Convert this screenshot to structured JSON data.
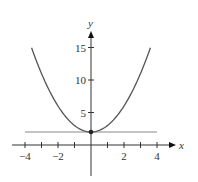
{
  "chart_data": {
    "type": "line",
    "title": "",
    "xlabel": "x",
    "ylabel": "y",
    "xlim": [
      -4.2,
      4.6
    ],
    "ylim": [
      -4,
      18
    ],
    "grid": false,
    "x_ticks": [
      -4,
      -3,
      -2,
      -1,
      1,
      2,
      3,
      4
    ],
    "x_tick_labels": [
      {
        "value": -4,
        "label": "−4"
      },
      {
        "value": -2,
        "label": "−2"
      },
      {
        "value": 2,
        "label": "2"
      },
      {
        "value": 4,
        "label": "4"
      }
    ],
    "y_ticks": [
      5,
      10,
      15
    ],
    "y_tick_labels": [
      {
        "value": 5,
        "label": "5"
      },
      {
        "value": 10,
        "label": "10"
      },
      {
        "value": 15,
        "label": "15"
      }
    ],
    "series": [
      {
        "name": "y = x^2 + 2",
        "kind": "curve",
        "color": "#555555",
        "x": [
          -3.6,
          -3,
          -2,
          -1,
          0,
          1,
          2,
          3,
          3.6
        ],
        "y": [
          14.96,
          11,
          6,
          3,
          2,
          3,
          6,
          11,
          14.96
        ]
      },
      {
        "name": "y = 2",
        "kind": "horizontal-line",
        "color": "#888888",
        "x": [
          -4,
          4
        ],
        "y": [
          2,
          2
        ]
      }
    ],
    "points": [
      {
        "x": 0,
        "y": 2,
        "label": "vertex"
      }
    ]
  },
  "axes": {
    "x_label": "x",
    "y_label": "y"
  }
}
